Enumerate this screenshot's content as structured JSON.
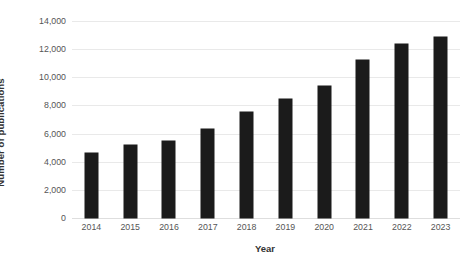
{
  "chart_data": {
    "type": "bar",
    "title": "",
    "subtitle": "",
    "xlabel": "Year",
    "ylabel": "Number of publications",
    "categories": [
      "2014",
      "2015",
      "2016",
      "2017",
      "2018",
      "2019",
      "2020",
      "2021",
      "2022",
      "2023"
    ],
    "values": [
      4600,
      5200,
      5500,
      6350,
      7500,
      8450,
      9400,
      11250,
      12400,
      12850
    ],
    "ylim": [
      0,
      14000
    ],
    "yticks": [
      0,
      2000,
      4000,
      6000,
      8000,
      10000,
      12000,
      14000
    ],
    "ytick_labels": [
      "0",
      "2,000",
      "4,000",
      "6,000",
      "8,000",
      "10,000",
      "12,000",
      "14,000"
    ],
    "grid": true,
    "grid_axis": "y",
    "legend": false,
    "legend_position": "none",
    "bar_color": "#1b1b1b",
    "grid_color": "#e9e9e9",
    "background_color": "#ffffff",
    "axis_label_color": "#333333",
    "tick_label_color": "#555555"
  }
}
